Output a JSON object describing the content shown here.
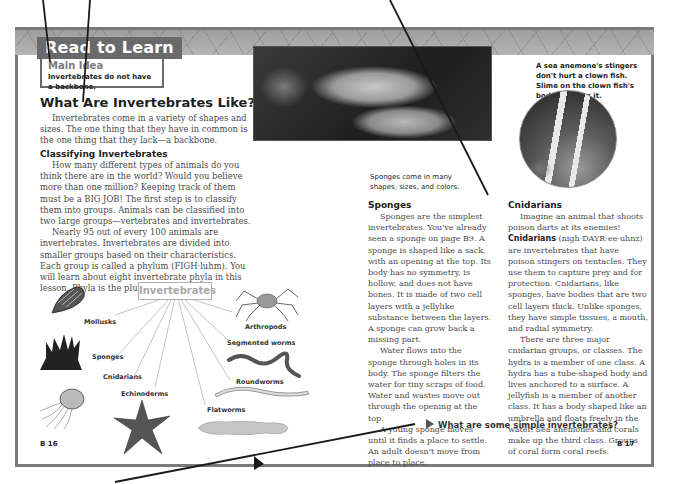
{
  "header": {
    "tab_label": "Read to Learn",
    "main_idea_label": "Main Idea",
    "main_idea_text": "Invertebrates do not have a backbone."
  },
  "left_page": {
    "section_title": "What Are Invertebrates Like?",
    "intro_paragraph": "Invertebrates come in a variety of shapes and sizes. The one thing that they have in common is the one thing that they lack—a backbone.",
    "subhead": "Classifying Invertebrates",
    "paragraph_1": "How many different types of animals do you think there are in the world? Would you believe more than one million? Keeping track of them must be a BIG JOB! The first step is to classify them into groups. Animals can be classified into two large groups—vertebrates and invertebrates.",
    "paragraph_2": "Nearly 95 out of every 100 animals are invertebrates. Invertebrates are divided into smaller groups based on their characteristics. Each group is called a phylum (FIGH·luhm). You will learn about eight invertebrate phyla in this lesson. Phyla is the plural of phylum.",
    "page_number": "B 16"
  },
  "diagram": {
    "title": "Invertebrates",
    "groups": [
      {
        "label": "Mollusks",
        "icon": "shell-icon"
      },
      {
        "label": "Sponges",
        "icon": "sponge-icon"
      },
      {
        "label": "Cnidarians",
        "icon": "jellyfish-icon"
      },
      {
        "label": "Echinoderms",
        "icon": "starfish-icon"
      },
      {
        "label": "Flatworms",
        "icon": "flatworm-icon"
      },
      {
        "label": "Roundworms",
        "icon": "roundworm-icon"
      },
      {
        "label": "Segmented worms",
        "icon": "earthworm-icon"
      },
      {
        "label": "Arthropods",
        "icon": "spider-icon"
      }
    ]
  },
  "right_page": {
    "sponge_photo_caption": "Sponges come in many shapes, sizes, and colors.",
    "clownfish_caption": "A sea anemone's stingers don't hurt a clown fish. Slime on the clown fish's body protects it.",
    "sponges": {
      "subhead": "Sponges",
      "paragraph_1": "Sponges are the simplest invertebrates. You've already seen a sponge on page B9. A sponge is shaped like a sack, with an opening at the top. Its body has no symmetry, is hollow, and does not have bones. It is made of two cell layers with a jellylike substance between the layers. A sponge can grow back a missing part.",
      "paragraph_2": "Water flows into the sponge through holes in its body. The sponge filters the water for tiny scraps of food. Water and wastes move out through the opening at the top.",
      "paragraph_3": "A young sponge moves until it finds a place to settle. An adult doesn't move from place to place."
    },
    "cnidarians": {
      "subhead": "Cnidarians",
      "paragraph_1_a": "Imagine an animal that shoots poison darts at its enemies! ",
      "term": "Cnidarians",
      "paragraph_1_b": " (nigh·DAYR·ee·uhnz) are invertebrates that have poison stingers on tentacles. They use them to capture prey and for protection. Cnidarians, like sponges, have bodies that are two cell layers thick. Unlike sponges, they have simple tissues, a mouth, and radial symmetry.",
      "paragraph_2": "There are three major cnidarian groups, or classes. The hydra is a member of one class. A hydra has a tube-shaped body and lives anchored to a surface. A jellyfish is a member of another class. It has a body shaped like an umbrella and floats freely in the water. Sea anemones and corals make up the third class. Groups of coral form coral reefs."
    },
    "question": "What are some simple invertebrates?",
    "page_number": "B 17"
  },
  "colors": {
    "frame": "#7a7a7a",
    "tab_bg": "#6a6a6a",
    "body_text": "#4a4a4a",
    "heading": "#1e1e1e"
  }
}
